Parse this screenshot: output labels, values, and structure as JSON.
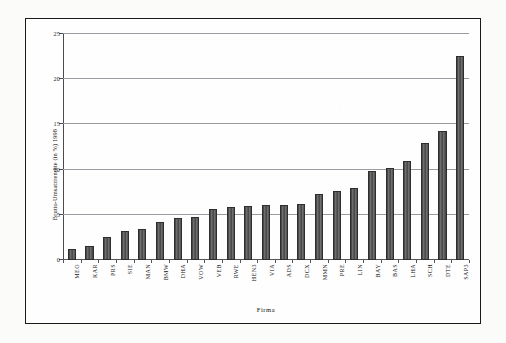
{
  "chart_data": {
    "type": "bar",
    "title": "",
    "xlabel": "Firma",
    "ylabel": "Brutto-Umsatzrendite (in %) 1998",
    "ylim": [
      0,
      25
    ],
    "yticks": [
      0,
      5,
      10,
      15,
      20,
      25
    ],
    "ytick_labels": [
      "0",
      "5",
      "10",
      "15",
      "20",
      "25"
    ],
    "grid": true,
    "legend": "none",
    "bar_color": "#5a5a5a",
    "bar_edge_color": "#2e2e2e",
    "categories": [
      "MEO",
      "KAR",
      "PRS",
      "SIE",
      "MAN",
      "BMW",
      "DHA",
      "VOW",
      "VEB",
      "RWE",
      "HEN3",
      "VIA",
      "ADS",
      "DCX",
      "MMN",
      "PRE",
      "LIN",
      "BAY",
      "BAS",
      "LHA",
      "SCH",
      "DTE",
      "SAP3"
    ],
    "values": [
      1.2,
      1.6,
      2.6,
      3.2,
      3.4,
      4.2,
      4.6,
      4.8,
      5.6,
      5.9,
      6.0,
      6.1,
      6.1,
      6.2,
      7.3,
      7.6,
      8.0,
      9.8,
      10.2,
      11.0,
      12.9,
      14.3,
      22.6
    ]
  },
  "figure": {
    "frame_color": "#1a1a1a",
    "background": "#fefefe"
  }
}
